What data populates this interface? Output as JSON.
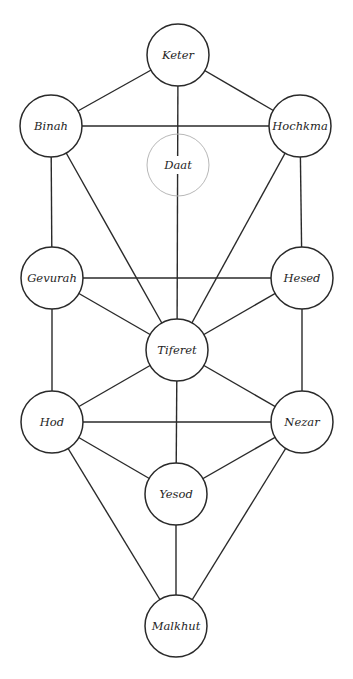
{
  "diagram": {
    "colors": {
      "line": "#2a2a2a",
      "ghost": "#b8b8b8",
      "background": "#ffffff",
      "text": "#1e1e1e"
    },
    "radius": 31,
    "nodes": [
      {
        "id": "keter",
        "label": "Keter",
        "x": 178,
        "y": 55
      },
      {
        "id": "binah",
        "label": "Binah",
        "x": 51,
        "y": 126
      },
      {
        "id": "hochkma",
        "label": "Hochkma",
        "x": 300,
        "y": 126
      },
      {
        "id": "daat",
        "label": "Daat",
        "x": 178,
        "y": 165,
        "ghost": true
      },
      {
        "id": "gevurah",
        "label": "Gevurah",
        "x": 52,
        "y": 278
      },
      {
        "id": "hesed",
        "label": "Hesed",
        "x": 302,
        "y": 278
      },
      {
        "id": "tiferet",
        "label": "Tiferet",
        "x": 177,
        "y": 350
      },
      {
        "id": "hod",
        "label": "Hod",
        "x": 52,
        "y": 422
      },
      {
        "id": "nezar",
        "label": "Nezar",
        "x": 302,
        "y": 422
      },
      {
        "id": "yesod",
        "label": "Yesod",
        "x": 176,
        "y": 494
      },
      {
        "id": "malkhut",
        "label": "Malkhut",
        "x": 176,
        "y": 626
      }
    ],
    "edges": [
      [
        "keter",
        "binah"
      ],
      [
        "keter",
        "hochkma"
      ],
      [
        "keter",
        "tiferet"
      ],
      [
        "binah",
        "hochkma"
      ],
      [
        "binah",
        "gevurah"
      ],
      [
        "binah",
        "tiferet"
      ],
      [
        "hochkma",
        "hesed"
      ],
      [
        "hochkma",
        "tiferet"
      ],
      [
        "gevurah",
        "hesed"
      ],
      [
        "gevurah",
        "tiferet"
      ],
      [
        "gevurah",
        "hod"
      ],
      [
        "hesed",
        "tiferet"
      ],
      [
        "hesed",
        "nezar"
      ],
      [
        "tiferet",
        "hod"
      ],
      [
        "tiferet",
        "nezar"
      ],
      [
        "tiferet",
        "yesod"
      ],
      [
        "hod",
        "nezar"
      ],
      [
        "hod",
        "yesod"
      ],
      [
        "hod",
        "malkhut"
      ],
      [
        "nezar",
        "yesod"
      ],
      [
        "nezar",
        "malkhut"
      ],
      [
        "yesod",
        "malkhut"
      ]
    ]
  }
}
